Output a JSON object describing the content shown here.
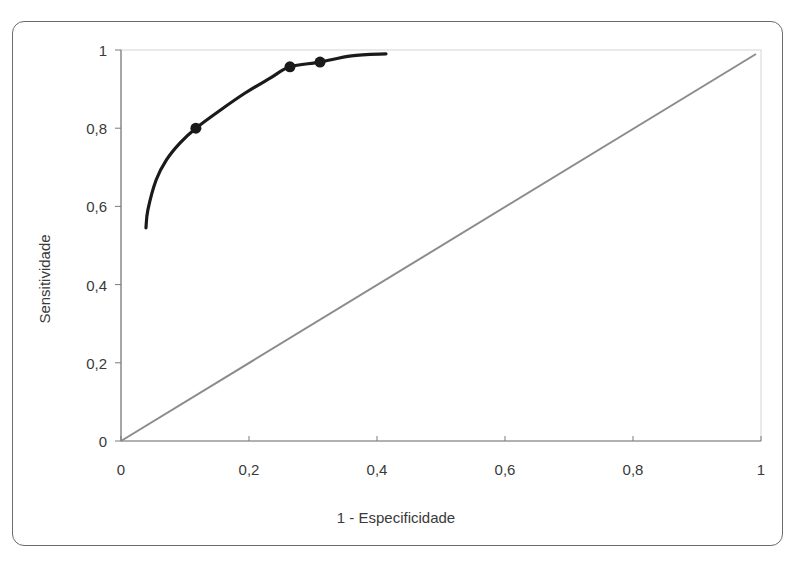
{
  "chart_data": {
    "type": "line",
    "title": "",
    "xlabel": "1 - Especificidade",
    "ylabel": "Sensitividade",
    "xlim": [
      0,
      1
    ],
    "ylim": [
      0,
      1
    ],
    "x_ticks": [
      "0",
      "0,2",
      "0,4",
      "0,6",
      "0,8",
      "1"
    ],
    "y_ticks": [
      "0",
      "0,2",
      "0,4",
      "0,6",
      "0,8",
      "1"
    ],
    "x_tick_values": [
      0,
      0.2,
      0.4,
      0.6,
      0.8,
      1
    ],
    "y_tick_values": [
      0,
      0.2,
      0.4,
      0.6,
      0.8,
      1
    ],
    "grid": false,
    "legend": null,
    "series": [
      {
        "name": "ROC curve",
        "style": "smooth-line",
        "color": "#1a1a1a",
        "x": [
          0.039,
          0.042,
          0.055,
          0.071,
          0.092,
          0.117,
          0.155,
          0.194,
          0.233,
          0.264,
          0.311,
          0.36,
          0.414
        ],
        "y": [
          0.545,
          0.591,
          0.668,
          0.719,
          0.762,
          0.8,
          0.846,
          0.89,
          0.928,
          0.957,
          0.969,
          0.985,
          0.99
        ]
      },
      {
        "name": "ROC points",
        "style": "markers",
        "color": "#1a1a1a",
        "x": [
          0.117,
          0.264,
          0.311
        ],
        "y": [
          0.8,
          0.957,
          0.969
        ]
      },
      {
        "name": "Reference line",
        "style": "line",
        "color": "#8c8c8c",
        "x": [
          0,
          1
        ],
        "y": [
          0,
          1
        ]
      }
    ]
  }
}
